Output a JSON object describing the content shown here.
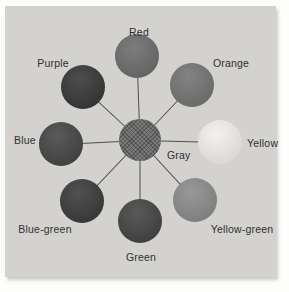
{
  "figure": {
    "type": "color-wheel-diagram",
    "page_color": "#fdfdfc",
    "panel_color": "#d3d2cf",
    "line_color": "#4f4f4f",
    "label_color": "#2f2f2f",
    "center": {
      "id": "gray",
      "label": "Gray",
      "color": "#7b7b7b",
      "x": 135,
      "y": 134,
      "r": 21,
      "label_x": 162,
      "label_y": 149,
      "label_align": "left"
    },
    "nodes": [
      {
        "id": "red",
        "label": "Red",
        "color": "#6e6e6e",
        "x": 132,
        "y": 50,
        "r": 22,
        "label_x": 134,
        "label_y": 26,
        "label_align": "center"
      },
      {
        "id": "orange",
        "label": "Orange",
        "color": "#757575",
        "x": 187,
        "y": 79,
        "r": 22,
        "label_x": 226,
        "label_y": 57,
        "label_align": "center"
      },
      {
        "id": "yellow",
        "label": "Yellow",
        "color": "#f1f0ec",
        "x": 215,
        "y": 136,
        "r": 22,
        "label_x": 242,
        "label_y": 137,
        "label_align": "left"
      },
      {
        "id": "yellow-green",
        "label": "Yellow-green",
        "color": "#8c8c8c",
        "x": 190,
        "y": 194,
        "r": 22,
        "label_x": 237,
        "label_y": 223,
        "label_align": "center"
      },
      {
        "id": "green",
        "label": "Green",
        "color": "#464646",
        "x": 135,
        "y": 215,
        "r": 22,
        "label_x": 136,
        "label_y": 251,
        "label_align": "center"
      },
      {
        "id": "blue-green",
        "label": "Blue-green",
        "color": "#3d3d3d",
        "x": 77,
        "y": 195,
        "r": 22,
        "label_x": 40,
        "label_y": 223,
        "label_align": "center"
      },
      {
        "id": "blue",
        "label": "Blue",
        "color": "#474747",
        "x": 56,
        "y": 138,
        "r": 22,
        "label_x": 20,
        "label_y": 134,
        "label_align": "center"
      },
      {
        "id": "purple",
        "label": "Purple",
        "color": "#393939",
        "x": 78,
        "y": 81,
        "r": 22,
        "label_x": 48,
        "label_y": 57,
        "label_align": "center"
      }
    ]
  }
}
